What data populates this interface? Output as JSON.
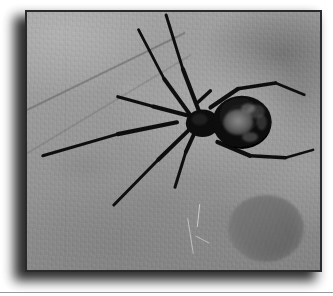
{
  "page": {
    "background_color": "#ffffff",
    "bottom_rule_color": "#9a9a9a"
  },
  "photo": {
    "caption": "Black widow spider hanging in its web",
    "subject": "black widow spider",
    "medium": "grayscale photograph",
    "frame_border_color": "#2a2a2a",
    "shadow_color": "#1b1b1b",
    "background_description": "mottled grey out-of-focus backdrop with faint web strands",
    "tones": {
      "highlight": "#b2b2b2",
      "midtone": "#959595",
      "shadow": "#757575",
      "spider_body": "#0d0d0d",
      "abdomen_marking": "#6f6f6f"
    },
    "elements": [
      {
        "name": "spider-body",
        "description": "dark bulbous abdomen with pale mottled dorsal markings and cephalothorax"
      },
      {
        "name": "spider-legs",
        "description": "eight long slender black legs splayed outward"
      },
      {
        "name": "web-strand-diagonal",
        "description": "faint diagonal silk line across the upper left"
      },
      {
        "name": "web-strand-wisp",
        "description": "bright wispy silk strand descending below the spider"
      },
      {
        "name": "blurred-blob",
        "description": "dark mottled circular out-of-focus object at lower right"
      }
    ]
  }
}
